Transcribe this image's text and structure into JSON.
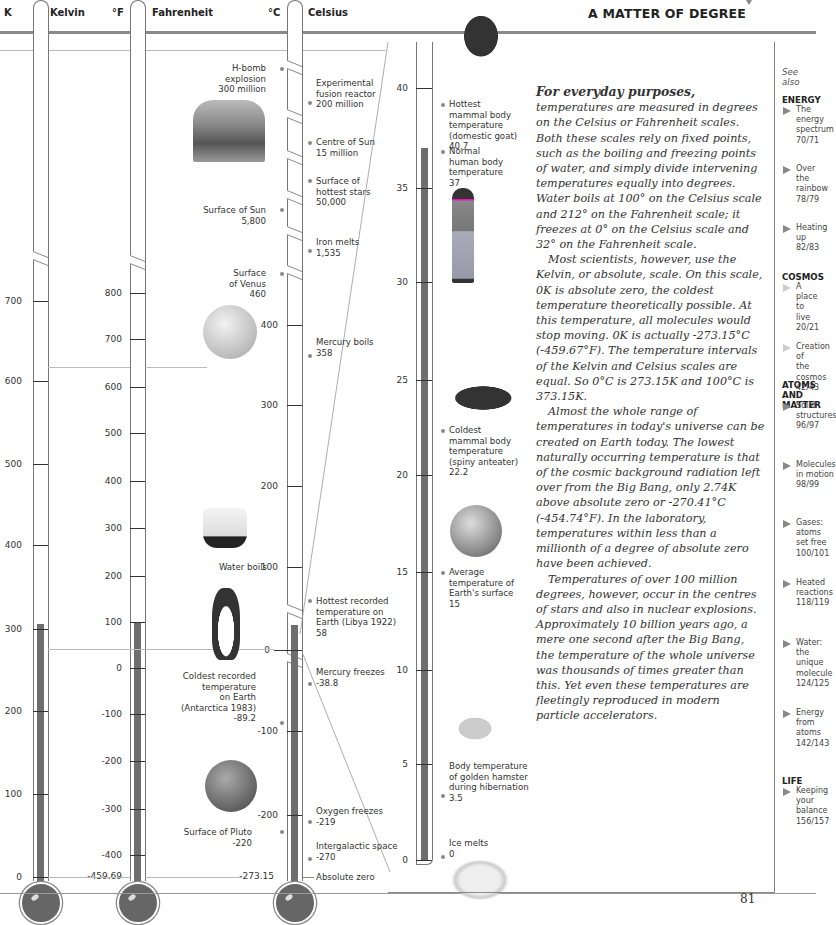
{
  "header": {
    "title": "A MATTER OF DEGREE",
    "scales": [
      {
        "unit": "K",
        "name": "Kelvin"
      },
      {
        "unit": "°F",
        "name": "Fahrenheit"
      },
      {
        "unit": "°C",
        "name": "Celsius"
      }
    ]
  },
  "kelvin_scale": {
    "ticks": [
      "700",
      "600",
      "500",
      "400",
      "300",
      "200",
      "100",
      "0"
    ]
  },
  "fahrenheit_scale": {
    "ticks": [
      "800",
      "700",
      "600",
      "500",
      "400",
      "300",
      "200",
      "100",
      "0",
      "-100",
      "-200",
      "-300",
      "-400",
      "-459.69"
    ]
  },
  "celsius_scale": {
    "ticks": [
      "400",
      "300",
      "200",
      "100",
      "0",
      "-100",
      "-200",
      "-273.15"
    ]
  },
  "zoom_scale": {
    "ticks": [
      "40",
      "35",
      "30",
      "25",
      "20",
      "15",
      "10",
      "5",
      "0"
    ]
  },
  "left_labels": {
    "hbomb": {
      "name": "H-bomb explosion",
      "line1": "H-bomb",
      "line2": "explosion",
      "value": "300 million"
    },
    "sun_surface": {
      "name": "Surface of Sun",
      "value": "5,800"
    },
    "venus": {
      "line1": "Surface",
      "line2": "of Venus",
      "value": "460"
    },
    "water_boils": {
      "name": "Water boils"
    },
    "coldest_earth": {
      "line1": "Coldest recorded",
      "line2": "temperature",
      "line3": "on Earth",
      "line4": "(Antarctica 1983)",
      "value": "-89.2"
    },
    "pluto": {
      "name": "Surface of Pluto",
      "value": "-220"
    }
  },
  "right_labels": {
    "fusion": {
      "line1": "Experimental",
      "line2": "fusion reactor",
      "value": "200 million"
    },
    "sun_centre": {
      "name": "Centre of Sun",
      "value": "15 million"
    },
    "hot_stars": {
      "line1": "Surface of",
      "line2": "hottest stars",
      "value": "50,000"
    },
    "iron": {
      "name": "Iron melts",
      "value": "1,535"
    },
    "mercury_boils": {
      "name": "Mercury boils",
      "value": "358"
    },
    "hottest_earth": {
      "line1": "Hottest recorded",
      "line2": "temperature on",
      "line3": "Earth (Libya 1922)",
      "value": "58"
    },
    "mercury_freezes": {
      "name": "Mercury freezes",
      "value": "-38.8"
    },
    "oxygen": {
      "name": "Oxygen freezes",
      "value": "-219"
    },
    "intergalactic": {
      "name": "Intergalactic space",
      "value": "-270"
    },
    "absolute_zero": {
      "name": "Absolute zero"
    }
  },
  "zoom_labels": {
    "goat": {
      "line1": "Hottest",
      "line2": "mammal body",
      "line3": "temperature",
      "line4": "(domestic goat)",
      "value": "40.7"
    },
    "human": {
      "line1": "Normal",
      "line2": "human body",
      "line3": "temperature",
      "value": "37"
    },
    "anteater": {
      "line1": "Coldest",
      "line2": "mammal body",
      "line3": "temperature",
      "line4": "(spiny anteater)",
      "value": "22.2"
    },
    "earth": {
      "line1": "Average",
      "line2": "temperature of",
      "line3": "Earth's surface",
      "value": "15"
    },
    "hamster": {
      "line1": "Body temperature",
      "line2": "of golden hamster",
      "line3": "during hibernation",
      "value": "3.5"
    },
    "ice": {
      "name": "Ice melts",
      "value": "0"
    }
  },
  "article": {
    "lead": "For everyday purposes,",
    "p1": " temperatures are measured in degrees on the Celsius or Fahrenheit scales. Both these scales rely on fixed points, such as the boiling and freezing points of water, and simply divide intervening temperatures equally into degrees. Water boils at 100° on the Celsius scale and 212° on the Fahrenheit scale; it freezes at 0° on the Celsius scale and 32° on the Fahrenheit scale.",
    "p2": "Most scientists, however, use the Kelvin, or absolute, scale. On this scale, 0K is absolute zero, the coldest temperature theoretically possible. At this temperature, all molecules would stop moving. 0K is actually -273.15°C (-459.67°F). The temperature intervals of the Kelvin and Celsius scales are equal. So 0°C is 273.15K and 100°C is 373.15K.",
    "p3": "Almost the whole range of temperatures in today's universe can be created on Earth today. The lowest naturally occurring temperature is that of the cosmic background radiation left over from the Big Bang, only 2.74K above absolute zero or -270.41°C (-454.74°F). In the laboratory, temperatures within less than a millionth of a degree of absolute zero have been achieved.",
    "p4": "Temperatures of over 100 million degrees, however, occur in the centres of stars and also in nuclear explosions. Approximately 10 billion years ago, a mere one second after the Big Bang, the temperature of the whole universe was thousands of times greater than this. Yet even these temperatures are fleetingly reproduced in modern particle accelerators."
  },
  "see_also": {
    "heading": "See also",
    "sections": [
      {
        "category": "ENERGY",
        "items": [
          {
            "l1": "The energy",
            "l2": "spectrum",
            "pages": "70/71"
          },
          {
            "l1": "Over the",
            "l2": "rainbow",
            "pages": "78/79"
          },
          {
            "l1": "Heating up",
            "l2": "",
            "pages": "82/83"
          }
        ]
      },
      {
        "category": "COSMOS",
        "items": [
          {
            "l1": "A place",
            "l2": "to live",
            "pages": "20/21"
          },
          {
            "l1": "Creation of",
            "l2": "the cosmos",
            "pages": "42/43"
          }
        ]
      },
      {
        "category": "ATOMS AND MATTER",
        "cat_l1": "ATOMS AND",
        "cat_l2": "MATTER",
        "items": [
          {
            "l1": "Solid",
            "l2": "structures",
            "pages": "96/97"
          },
          {
            "l1": "Molecules",
            "l2": "in motion",
            "pages": "98/99"
          },
          {
            "l1": "Gases: atoms",
            "l2": "set free",
            "pages": "100/101"
          },
          {
            "l1": "Heated",
            "l2": "reactions",
            "pages": "118/119"
          },
          {
            "l1": "Water:",
            "l2": "the unique",
            "l3": "molecule",
            "pages": "124/125"
          },
          {
            "l1": "Energy",
            "l2": "from atoms",
            "pages": "142/143"
          }
        ]
      },
      {
        "category": "LIFE",
        "items": [
          {
            "l1": "Keeping",
            "l2": "your balance",
            "pages": "156/157"
          }
        ]
      }
    ]
  },
  "footer": {
    "page_number": "81"
  },
  "colors": {
    "mercury": "#6e6e6e",
    "rule": "#8a8a8a",
    "tube_outline": "#777777"
  }
}
